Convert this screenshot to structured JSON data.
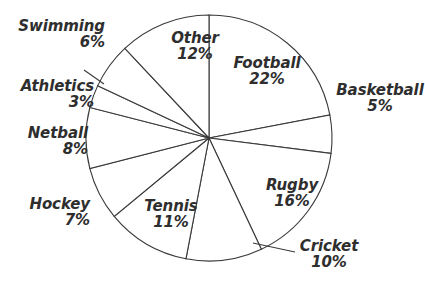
{
  "chart_data": {
    "type": "pie",
    "title": "",
    "subtitle": "",
    "xlabel": "",
    "ylabel": "",
    "legend_position": "none",
    "grid": false,
    "value_unit": "percent",
    "total": 100,
    "start_angle_deg": 0,
    "direction": "clockwise",
    "categories": [
      "Football",
      "Basketball",
      "Rugby",
      "Cricket",
      "Tennis",
      "Hockey",
      "Netball",
      "Athletics",
      "Swimming",
      "Other"
    ],
    "values": [
      22,
      5,
      16,
      10,
      11,
      7,
      8,
      3,
      6,
      12
    ],
    "slices": [
      {
        "label": "Football",
        "value": 22,
        "pct_text": "22%",
        "label_placement": "inside",
        "has_leader_line": false
      },
      {
        "label": "Basketball",
        "value": 5,
        "pct_text": "5%",
        "label_placement": "outside",
        "has_leader_line": false
      },
      {
        "label": "Rugby",
        "value": 16,
        "pct_text": "16%",
        "label_placement": "inside",
        "has_leader_line": false
      },
      {
        "label": "Cricket",
        "value": 10,
        "pct_text": "10%",
        "label_placement": "outside",
        "has_leader_line": true
      },
      {
        "label": "Tennis",
        "value": 11,
        "pct_text": "11%",
        "label_placement": "inside",
        "has_leader_line": false
      },
      {
        "label": "Hockey",
        "value": 7,
        "pct_text": "7%",
        "label_placement": "outside",
        "has_leader_line": false
      },
      {
        "label": "Netball",
        "value": 8,
        "pct_text": "8%",
        "label_placement": "outside",
        "has_leader_line": false
      },
      {
        "label": "Athletics",
        "value": 3,
        "pct_text": "3%",
        "label_placement": "outside",
        "has_leader_line": false
      },
      {
        "label": "Swimming",
        "value": 6,
        "pct_text": "6%",
        "label_placement": "outside",
        "has_leader_line": true
      },
      {
        "label": "Other",
        "value": 12,
        "pct_text": "12%",
        "label_placement": "inside",
        "has_leader_line": false
      }
    ]
  },
  "style": {
    "slice_fill": "#ffffff",
    "slice_stroke": "#3a3a3a",
    "text_color": "#2e2e2e",
    "leader_line_color": "#3a3a3a",
    "background": "#ffffff"
  }
}
